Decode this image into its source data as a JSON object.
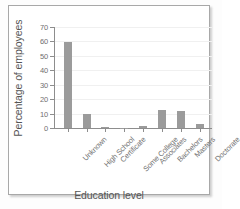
{
  "chart_data": {
    "type": "bar",
    "title": "",
    "xlabel": "Education level",
    "ylabel": "Percentage of employees",
    "categories": [
      "Unknown",
      "High School",
      "Certificate",
      "Some College",
      "Associates",
      "Bachelors",
      "Masters",
      "Doctorate"
    ],
    "values": [
      59.8,
      9.8,
      0.7,
      0.15,
      1.6,
      12.5,
      11.5,
      3.0
    ],
    "ylim": [
      0,
      70
    ],
    "yticks": [
      0,
      10,
      20,
      30,
      40,
      50,
      60,
      70
    ],
    "grid": true,
    "legend": false,
    "bar_color": "#9b9b9b",
    "axis_color": "#8d8d8d",
    "x_tick_rotation": -45
  },
  "figure": {
    "background": "#ffffff",
    "frame_color": "#a8a8a8"
  }
}
